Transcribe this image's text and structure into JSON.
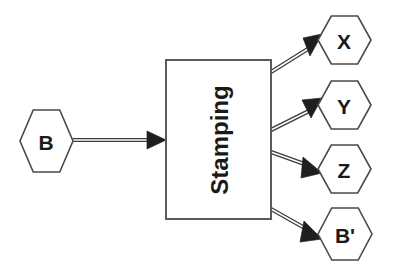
{
  "diagram": {
    "background_color": "#ffffff",
    "node_stroke_color": "#4a4a4a",
    "node_fill_color": "#ffffff",
    "text_color": "#1a1a1a",
    "connector_color": "#3c3c3c",
    "input": {
      "id": "B",
      "label": "B",
      "shape": "hexagon",
      "center": {
        "x": 46,
        "y": 141
      },
      "width": 53,
      "height": 62
    },
    "process": {
      "id": "stamping",
      "label": "Stamping",
      "shape": "rectangle",
      "text_orientation": "vertical-bottom-to-top",
      "x": 166,
      "y": 60,
      "width": 105,
      "height": 159
    },
    "outputs": [
      {
        "id": "X",
        "label": "X",
        "shape": "hexagon",
        "center": {
          "x": 344,
          "y": 40
        },
        "width": 53,
        "height": 49
      },
      {
        "id": "Y",
        "label": "Y",
        "shape": "hexagon",
        "center": {
          "x": 344,
          "y": 105
        },
        "width": 53,
        "height": 49
      },
      {
        "id": "Z",
        "label": "Z",
        "shape": "hexagon",
        "center": {
          "x": 344,
          "y": 169
        },
        "width": 53,
        "height": 49
      },
      {
        "id": "Bprime",
        "label": "B'",
        "shape": "hexagon",
        "center": {
          "x": 345,
          "y": 234
        },
        "width": 55,
        "height": 52
      }
    ],
    "connectors": [
      {
        "id": "b-to-stamping",
        "from": "B",
        "to": "stamping",
        "style": "double-line-solid-arrow",
        "from_point": {
          "x": 73,
          "y": 140
        },
        "to_point": {
          "x": 166,
          "y": 140
        }
      },
      {
        "id": "stamping-to-x",
        "from": "stamping",
        "to": "X",
        "style": "double-line-solid-arrow",
        "from_point": {
          "x": 271,
          "y": 72
        },
        "to_point": {
          "x": 319,
          "y": 42
        }
      },
      {
        "id": "stamping-to-y",
        "from": "stamping",
        "to": "Y",
        "style": "double-line-solid-arrow",
        "from_point": {
          "x": 271,
          "y": 130
        },
        "to_point": {
          "x": 319,
          "y": 104
        }
      },
      {
        "id": "stamping-to-z",
        "from": "stamping",
        "to": "Z",
        "style": "double-line-solid-arrow",
        "from_point": {
          "x": 271,
          "y": 152
        },
        "to_point": {
          "x": 319,
          "y": 171
        }
      },
      {
        "id": "stamping-to-bprime",
        "from": "stamping",
        "to": "Bprime",
        "style": "double-line-solid-arrow",
        "from_point": {
          "x": 271,
          "y": 209
        },
        "to_point": {
          "x": 319,
          "y": 236
        }
      }
    ]
  }
}
